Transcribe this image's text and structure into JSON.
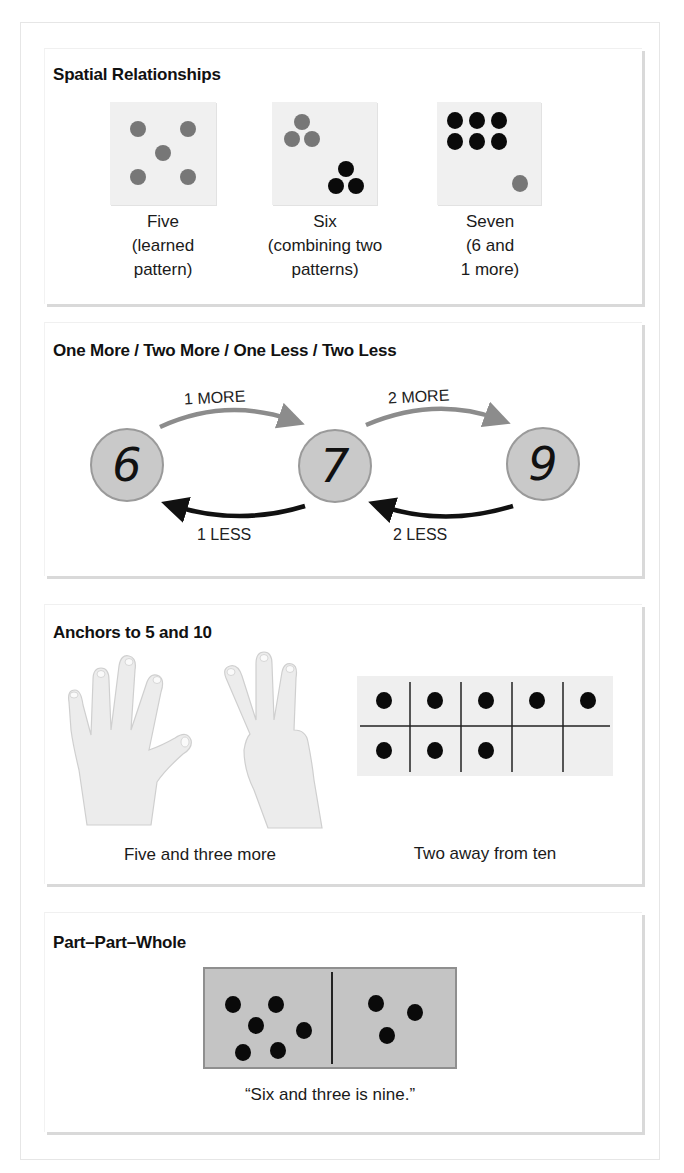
{
  "panels": {
    "spatial": {
      "title": "Spatial Relationships",
      "cards": [
        {
          "caption_lines": [
            "Five",
            "(learned",
            "pattern)"
          ],
          "label": "five-card"
        },
        {
          "caption_lines": [
            "Six",
            "(combining two",
            "patterns)"
          ],
          "label": "six-card"
        },
        {
          "caption_lines": [
            "Seven",
            "(6 and",
            "1 more)"
          ],
          "label": "seven-card"
        }
      ]
    },
    "more_less": {
      "title": "One More / Two More / One Less / Two Less",
      "numbers": [
        "6",
        "7",
        "9"
      ],
      "arrows": {
        "one_more": "1 MORE",
        "two_more": "2 MORE",
        "one_less": "1 LESS",
        "two_less": "2 LESS"
      }
    },
    "anchors": {
      "title": "Anchors to 5 and 10",
      "hands_caption": "Five and three more",
      "tenframe_caption": "Two away from ten",
      "tenframe_filled": 8,
      "tenframe_total": 10
    },
    "part_whole": {
      "title": "Part–Part–Whole",
      "left_count": 6,
      "right_count": 3,
      "caption": "“Six and three is nine.”"
    }
  },
  "colors": {
    "dot_gray": "#777777",
    "dot_black": "#0a0a0a",
    "card_bg": "#f0f0f0",
    "circle_fill": "#c9c9c9",
    "arrow_more": "#8c8c8c",
    "arrow_less": "#111111",
    "domino_fill": "#c4c4c4",
    "hand_fill": "#ececec"
  }
}
